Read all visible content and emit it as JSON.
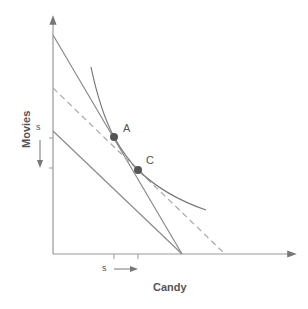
{
  "axes": {
    "x_label": "Candy",
    "y_label": "Movies"
  },
  "points": [
    {
      "label": "A"
    },
    {
      "label": "C"
    }
  ],
  "shift_labels": {
    "x": "s",
    "y": "s"
  },
  "colors": {
    "line": "#8a8a8a",
    "dashed": "#a8a8a8",
    "point": "#555555",
    "text": "#555555"
  }
}
